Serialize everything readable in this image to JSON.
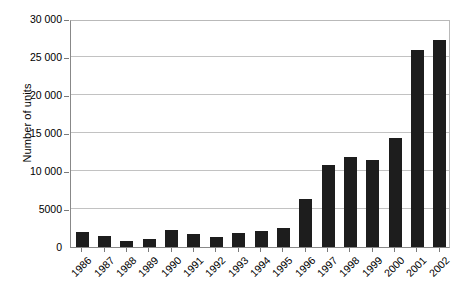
{
  "chart_data": {
    "type": "bar",
    "title": "",
    "subtitle": "",
    "xlabel": "",
    "ylabel": "Number of units",
    "categories": [
      "1986",
      "1987",
      "1988",
      "1989",
      "1990",
      "1991",
      "1992",
      "1993",
      "1994",
      "1995",
      "1996",
      "1997",
      "1998",
      "1999",
      "2000",
      "2001",
      "2002"
    ],
    "values": [
      2000,
      1500,
      800,
      1100,
      2200,
      1700,
      1300,
      1800,
      2100,
      2500,
      6300,
      10800,
      11900,
      11400,
      14300,
      25900,
      27300
    ],
    "series": [
      {
        "name": "Number of units",
        "values": [
          2000,
          1500,
          800,
          1100,
          2200,
          1700,
          1300,
          1800,
          2100,
          2500,
          6300,
          10800,
          11900,
          11400,
          14300,
          25900,
          27300
        ]
      }
    ],
    "ylim": [
      0,
      30000
    ],
    "yticks": [
      0,
      5000,
      10000,
      15000,
      20000,
      25000,
      30000
    ],
    "ytick_labels": [
      "0",
      "5000",
      "10 000",
      "15 000",
      "20 000",
      "25 000",
      "30 000"
    ],
    "grid": true,
    "grid_axis": "y",
    "legend": false,
    "legend_position": "none",
    "bar_color": "#1d1d1d",
    "gridline_color": "#c2c2c2",
    "axis_color": "#888888",
    "background_color": "#ffffff",
    "xtick_rotation": -45
  }
}
